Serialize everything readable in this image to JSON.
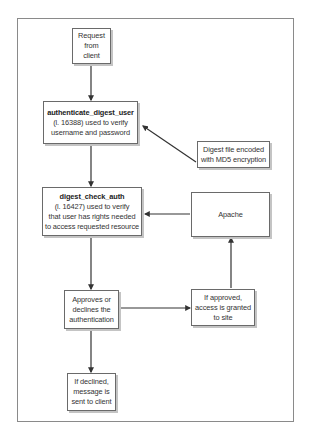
{
  "diagram": {
    "nodes": {
      "request": {
        "lines": [
          "Request",
          "from",
          "client"
        ]
      },
      "authenticate": {
        "title": "authenticate_digest_user",
        "lines": [
          "(l. 16388) used to verify",
          "username and password"
        ]
      },
      "digest_file": {
        "lines": [
          "Digest file encoded",
          "with MD5 encryption"
        ]
      },
      "check_auth": {
        "title": "digest_check_auth",
        "lines": [
          "(l. 16427) used to verify",
          "that user has rights needed",
          "to access requested resource"
        ]
      },
      "apache": {
        "lines": [
          "Apache"
        ]
      },
      "approves": {
        "lines": [
          "Approves or",
          "declines the",
          "authentication"
        ]
      },
      "approved": {
        "lines": [
          "If approved,",
          "access is granted",
          "to site"
        ]
      },
      "declined": {
        "lines": [
          "If declined,",
          "message is",
          "sent to client"
        ]
      }
    },
    "edges": [
      {
        "from": "request",
        "to": "authenticate"
      },
      {
        "from": "digest_file",
        "to": "authenticate"
      },
      {
        "from": "authenticate",
        "to": "check_auth"
      },
      {
        "from": "apache",
        "to": "check_auth"
      },
      {
        "from": "check_auth",
        "to": "approves"
      },
      {
        "from": "approves",
        "to": "approved"
      },
      {
        "from": "approved",
        "to": "apache"
      },
      {
        "from": "approves",
        "to": "declined"
      }
    ]
  }
}
